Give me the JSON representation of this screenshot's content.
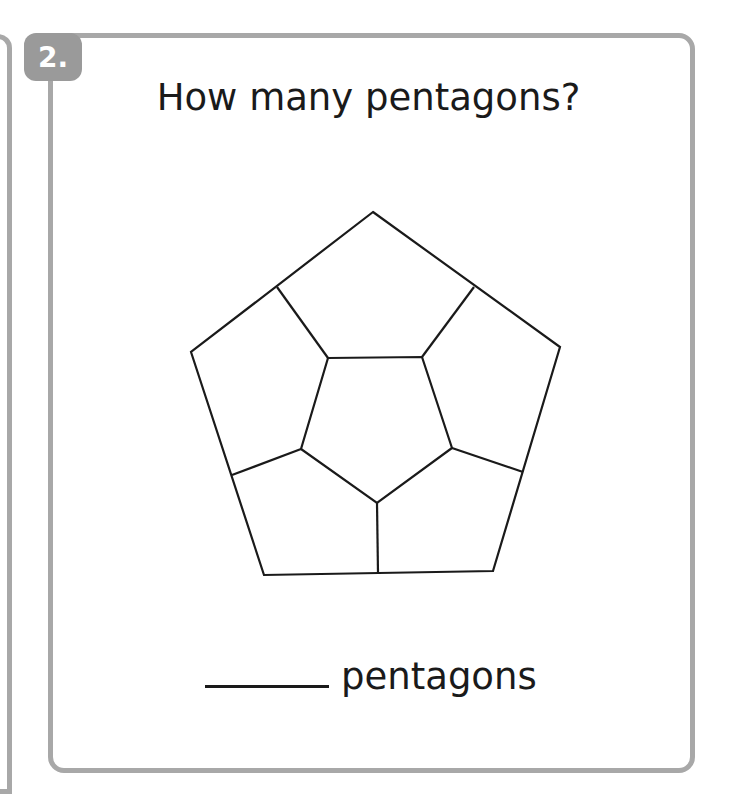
{
  "question": {
    "number": "2.",
    "prompt": "How many pentagons?",
    "answer_blank": "",
    "answer_unit": "pentagons"
  },
  "figure": {
    "stroke_color": "#1a1a1a"
  },
  "colors": {
    "border": "#a8a8a8",
    "badge": "#9a9a9a",
    "text": "#1a1a1a"
  }
}
